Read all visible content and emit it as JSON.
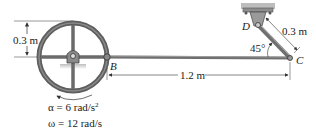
{
  "diagram": {
    "labels": {
      "wheel_radius": "0.3 m",
      "point_b": "B",
      "point_c": "C",
      "point_d": "D",
      "link_dc_length": "0.3 m",
      "rod_bc_length": "1.2 m",
      "angle": "45°",
      "alpha_eq": "α = 6 rad/s",
      "alpha_sup": "2",
      "omega_eq": "ω = 12 rad/s"
    },
    "colors": {
      "wheel": "#6b6b6b",
      "wheel_dark": "#4a4a4a",
      "rod": "#707070",
      "support": "#8a8a8a",
      "dimension": "#333333"
    },
    "components": [
      "wheel",
      "rod-bc",
      "link-dc",
      "pin-support-d",
      "wheel-hub-support"
    ]
  }
}
